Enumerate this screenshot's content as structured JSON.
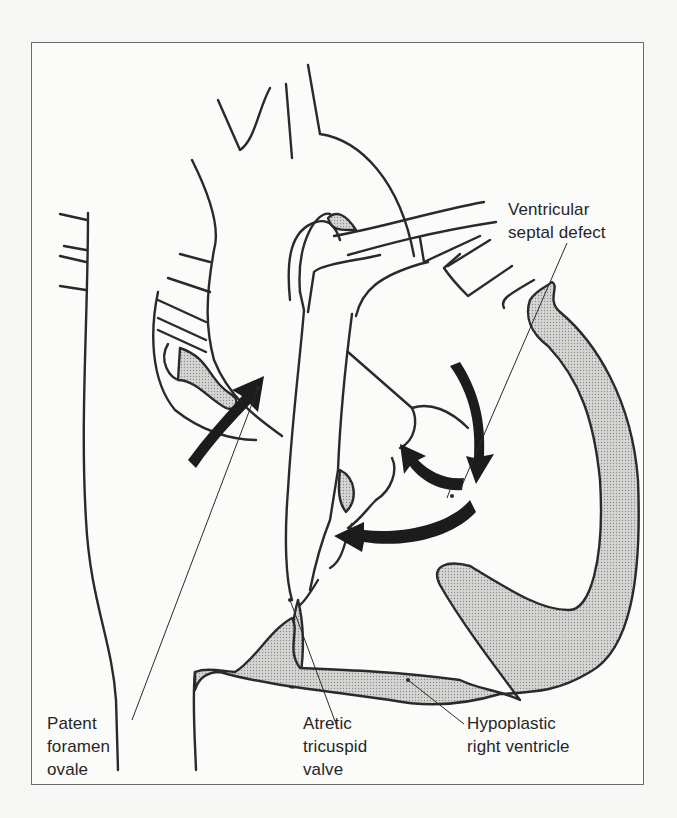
{
  "figure": {
    "colors": {
      "line": "#2a2a2a",
      "stipple": "#c9c9c7",
      "arrow": "#1c1c1c",
      "frame": "#6a6a6a",
      "background": "#fbfbfa"
    }
  },
  "labels": {
    "vsd": {
      "line1": "Ventricular",
      "line2": "septal defect"
    },
    "pfo": {
      "line1": "Patent",
      "line2": "foramen",
      "line3": "ovale"
    },
    "atv": {
      "line1": "Atretic",
      "line2": "tricuspid",
      "line3": "valve"
    },
    "hrv": {
      "line1": "Hypoplastic",
      "line2": "right ventricle"
    }
  },
  "arrows": {
    "count": 5,
    "meaning": "blood flow direction"
  }
}
